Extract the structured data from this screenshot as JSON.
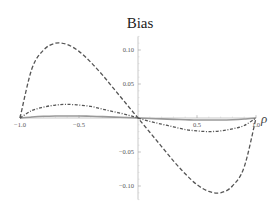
{
  "chart_data": {
    "type": "line",
    "title": "Bias",
    "xlabel": "ρ",
    "ylabel": "",
    "xlim": [
      -1.0,
      1.0
    ],
    "ylim": [
      -0.12,
      0.12
    ],
    "grid": false,
    "legend": null,
    "x_ticks": [
      -1.0,
      -0.5,
      0.5,
      1.0
    ],
    "x_tick_labels": [
      "-1.0",
      "-0.5",
      "0.5",
      "1.0"
    ],
    "y_ticks": [
      0.1,
      0.05,
      -0.05,
      -0.1
    ],
    "y_tick_labels": [
      "0.10",
      "0.05",
      "-0.05",
      "-0.10"
    ],
    "x": [
      -1.0,
      -0.9,
      -0.8,
      -0.7,
      -0.6,
      -0.5,
      -0.4,
      -0.3,
      -0.2,
      -0.1,
      0.0,
      0.1,
      0.2,
      0.3,
      0.4,
      0.5,
      0.6,
      0.7,
      0.8,
      0.9,
      1.0
    ],
    "series": [
      {
        "name": "large-bias (dashed)",
        "style": "dashed",
        "color": "#555555",
        "values": [
          0.0,
          0.072,
          0.1,
          0.11,
          0.108,
          0.098,
          0.082,
          0.063,
          0.042,
          0.021,
          0.0,
          -0.021,
          -0.042,
          -0.063,
          -0.082,
          -0.098,
          -0.108,
          -0.11,
          -0.1,
          -0.072,
          0.0
        ]
      },
      {
        "name": "small-bias (dash-dot)",
        "style": "dash-dot",
        "color": "#555555",
        "values": [
          0.0,
          0.011,
          0.016,
          0.019,
          0.02,
          0.019,
          0.017,
          0.013,
          0.009,
          0.005,
          0.0,
          -0.005,
          -0.009,
          -0.013,
          -0.017,
          -0.019,
          -0.02,
          -0.019,
          -0.016,
          -0.011,
          0.0
        ]
      },
      {
        "name": "near-zero (solid)",
        "style": "solid",
        "color": "#999999",
        "values": [
          0.0,
          0.0015,
          0.0025,
          0.003,
          0.003,
          0.003,
          0.0025,
          0.002,
          0.0013,
          0.0007,
          0.0,
          -0.0007,
          -0.0013,
          -0.002,
          -0.0025,
          -0.003,
          -0.003,
          -0.003,
          -0.0025,
          -0.0015,
          0.0
        ]
      }
    ]
  },
  "plot": {
    "title": "Bias",
    "x_axis_label": "ρ"
  }
}
